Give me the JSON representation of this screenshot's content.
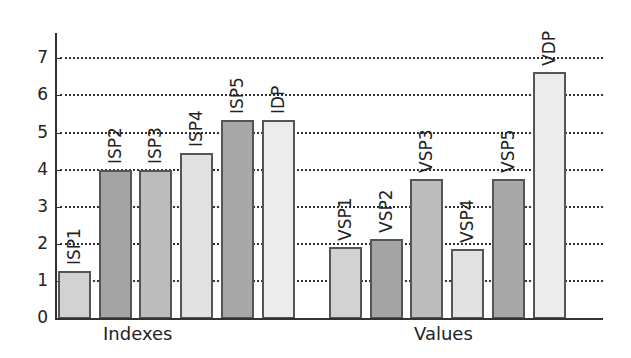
{
  "chart_data": {
    "type": "bar",
    "title": "",
    "xlabel": "",
    "ylabel": "",
    "ylim": [
      0,
      7.6
    ],
    "yticks": [
      0,
      1,
      2,
      3,
      4,
      5,
      6,
      7
    ],
    "grid": {
      "y": true,
      "style": "dotted"
    },
    "legend": null,
    "groups": [
      {
        "name": "Indexes",
        "bars": [
          {
            "label": "ISP1",
            "value": 1.27,
            "color": "#d2d2d2"
          },
          {
            "label": "ISP2",
            "value": 4.0,
            "color": "#a4a4a4"
          },
          {
            "label": "ISP3",
            "value": 4.0,
            "color": "#bcbcbc"
          },
          {
            "label": "ISP4",
            "value": 4.45,
            "color": "#e2e2e2"
          },
          {
            "label": "ISP5",
            "value": 5.33,
            "color": "#a8a8a8"
          },
          {
            "label": "IDP",
            "value": 5.33,
            "color": "#ececec"
          }
        ]
      },
      {
        "name": "Values",
        "bars": [
          {
            "label": "VSP1",
            "value": 1.92,
            "color": "#d2d2d2"
          },
          {
            "label": "VSP2",
            "value": 2.13,
            "color": "#a4a4a4"
          },
          {
            "label": "VSP3",
            "value": 3.75,
            "color": "#bcbcbc"
          },
          {
            "label": "VSP4",
            "value": 1.85,
            "color": "#e2e2e2"
          },
          {
            "label": "VSP5",
            "value": 3.75,
            "color": "#a8a8a8"
          },
          {
            "label": "VDP",
            "value": 6.63,
            "color": "#ececec"
          }
        ]
      }
    ]
  }
}
